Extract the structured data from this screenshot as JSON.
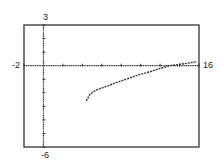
{
  "chart_data": {
    "type": "line",
    "title": "",
    "xlabel": "",
    "ylabel": "",
    "xlim": [
      -2,
      16
    ],
    "ylim": [
      -6,
      3
    ],
    "x_tick_step": 2,
    "y_tick_step": 1,
    "grid": false,
    "legend": null,
    "window_labels": {
      "ymax": "3",
      "ymin": "-6",
      "xmin": "-2",
      "xmax": "16"
    },
    "series": [
      {
        "name": "curve",
        "style": "dotted",
        "x": [
          4.4,
          4.8,
          5.4,
          6.2,
          7.7,
          8.9,
          9.9,
          10.95,
          12.0,
          13.0,
          14.6,
          15.8
        ],
        "y": [
          -2.6,
          -2.1,
          -1.8,
          -1.6,
          -1.2,
          -0.9,
          -0.65,
          -0.45,
          -0.2,
          0.0,
          0.15,
          0.3
        ]
      }
    ]
  },
  "colors": {
    "frame": "#333333",
    "axis": "#333333",
    "curve": "#333333",
    "background": "#ffffff"
  }
}
